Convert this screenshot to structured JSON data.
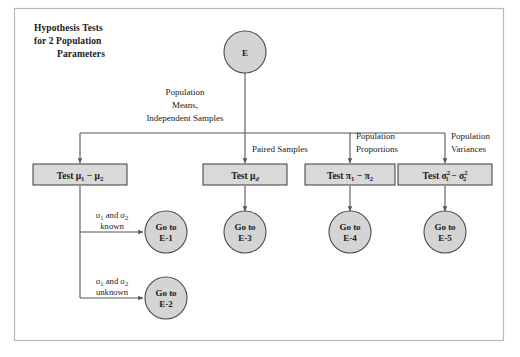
{
  "figure": {
    "title_lines": [
      "Hypothesis Tests",
      "for 2 Population",
      "Parameters"
    ],
    "frame_color": "#b9b9b9",
    "node_fill": "#d9d9d9",
    "circle_fill": "#d4d4d4",
    "node_stroke": "#4a4a4a",
    "connector_color": "#555555",
    "background": "#ffffff"
  },
  "root": {
    "label": "E"
  },
  "branch_labels": {
    "means": [
      "Population",
      "Means,",
      "Independent Samples"
    ],
    "paired": [
      "Paired Samples"
    ],
    "proportions": [
      "Population",
      "Proportions"
    ],
    "variances": [
      "Population",
      "Variances"
    ]
  },
  "tests": {
    "means": {
      "prefix": "Test ",
      "symbol": "μ",
      "sub1": "1",
      "operator": " − ",
      "sub2": "2",
      "plain": "Test μ1 − μ2"
    },
    "paired": {
      "prefix": "Test ",
      "symbol": "μ",
      "sub": "d",
      "plain": "Test μd"
    },
    "proportions": {
      "prefix": "Test ",
      "symbol": "π",
      "sub1": "1",
      "operator": " − ",
      "sub2": "2",
      "plain": "Test π1 − π2"
    },
    "variances": {
      "prefix": "Test ",
      "symbol": "σ",
      "sub1": "1",
      "sup1": "2",
      "operator": " − ",
      "sub2": "2",
      "sup2": "2",
      "plain": "Test σ²₁ − σ²₂"
    }
  },
  "conditions": {
    "known": {
      "sigma": "σ",
      "sub1": "1",
      "conj": " and ",
      "sub2": "2",
      "state": "known",
      "plain": "σ1 and σ2 known"
    },
    "unknown": {
      "sigma": "σ",
      "sub1": "1",
      "conj": " and ",
      "sub2": "2",
      "state": "unknown",
      "plain": "σ1 and σ2 unknown"
    }
  },
  "goto_nodes": [
    {
      "line1": "Go to",
      "line2": "E-1"
    },
    {
      "line1": "Go to",
      "line2": "E-2"
    },
    {
      "line1": "Go to",
      "line2": "E-3"
    },
    {
      "line1": "Go to",
      "line2": "E-4"
    },
    {
      "line1": "Go to",
      "line2": "E-5"
    }
  ]
}
